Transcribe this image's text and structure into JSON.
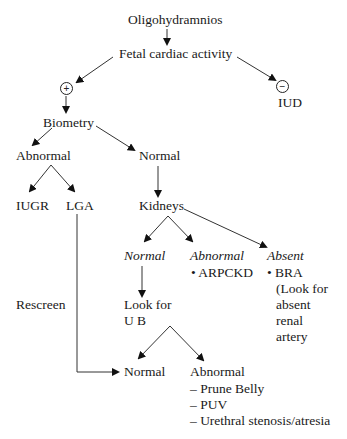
{
  "diagram": {
    "root": "Oligohydramnios",
    "step1": "Fetal cardiac activity",
    "positive_symbol": "+",
    "negative_symbol": "−",
    "negative_outcome": "IUD",
    "biometry": "Biometry",
    "biometry_abnormal": "Abnormal",
    "biometry_normal": "Normal",
    "iugr": "IUGR",
    "lga": "LGA",
    "kidneys": "Kidneys",
    "kidney_normal": "Normal",
    "kidney_abnormal": "Abnormal",
    "kidney_abnormal_item": "• ARPCKD",
    "kidney_absent": "Absent",
    "kidney_absent_lines": [
      "• BRA",
      "(Look for",
      "absent",
      "renal",
      "artery"
    ],
    "rescreen": "Rescreen",
    "look_for_ub_lines": [
      "Look for",
      "U B"
    ],
    "ub_normal": "Normal",
    "ub_abnormal": "Abnormal",
    "ub_abnormal_items": [
      "– Prune Belly",
      "– PUV",
      "– Urethral stenosis/atresia"
    ]
  }
}
